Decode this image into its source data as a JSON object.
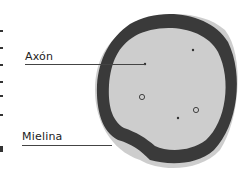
{
  "diagram": {
    "labels": {
      "axon": "Axón",
      "myelin": "Mielina"
    },
    "colors": {
      "background": "#ffffff",
      "myelin_sheath": "#3a3a3a",
      "axoplasm": "#cfcfcf",
      "outer_tissue": "#bdbdbd",
      "label_text": "#222222",
      "leader_line": "#444444"
    }
  }
}
